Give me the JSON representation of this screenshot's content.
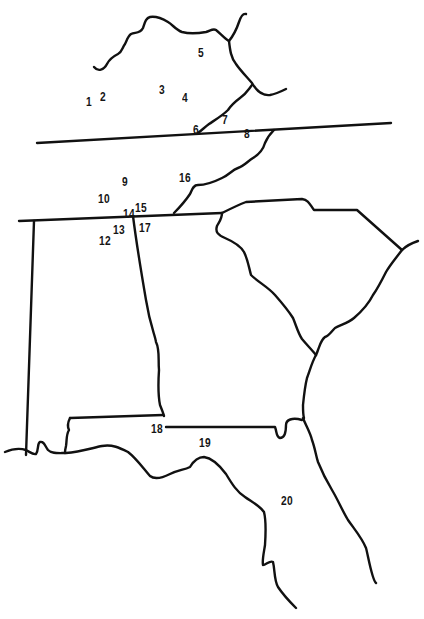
{
  "map": {
    "description": "Outline map of the southeastern United States with numbered site locations",
    "line_color": "#111111",
    "background": "#ffffff",
    "sites": [
      {
        "id": "1",
        "label": "1",
        "x": 88,
        "y": 97
      },
      {
        "id": "2",
        "label": "2",
        "x": 100,
        "y": 92
      },
      {
        "id": "3",
        "label": "3",
        "x": 160,
        "y": 85
      },
      {
        "id": "4",
        "label": "4",
        "x": 182,
        "y": 92
      },
      {
        "id": "5",
        "label": "5",
        "x": 198,
        "y": 47
      },
      {
        "id": "6",
        "label": "6",
        "x": 194,
        "y": 125
      },
      {
        "id": "7",
        "label": "7",
        "x": 222,
        "y": 115
      },
      {
        "id": "8",
        "label": "8",
        "x": 244,
        "y": 129
      },
      {
        "id": "9",
        "label": "9",
        "x": 122,
        "y": 176
      },
      {
        "id": "10",
        "label": "10",
        "x": 98,
        "y": 193
      },
      {
        "id": "11",
        "label": "",
        "x": 0,
        "y": 0
      },
      {
        "id": "12",
        "label": "12",
        "x": 99,
        "y": 235
      },
      {
        "id": "13",
        "label": "13",
        "x": 113,
        "y": 224
      },
      {
        "id": "14",
        "label": "14",
        "x": 123,
        "y": 208
      },
      {
        "id": "15",
        "label": "15",
        "x": 135,
        "y": 202
      },
      {
        "id": "16",
        "label": "16",
        "x": 179,
        "y": 172
      },
      {
        "id": "17",
        "label": "17",
        "x": 139,
        "y": 222
      },
      {
        "id": "18",
        "label": "18",
        "x": 151,
        "y": 423
      },
      {
        "id": "19",
        "label": "19",
        "x": 199,
        "y": 437
      },
      {
        "id": "20",
        "label": "20",
        "x": 281,
        "y": 495
      }
    ],
    "caption_visible_fragment": ""
  }
}
